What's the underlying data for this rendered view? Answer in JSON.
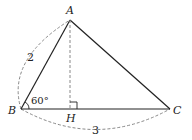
{
  "diagram": {
    "type": "triangle-geometry",
    "points": {
      "A": {
        "label": "A",
        "x": 70,
        "y": 20
      },
      "B": {
        "label": "B",
        "x": 21,
        "y": 109
      },
      "C": {
        "label": "C",
        "x": 170,
        "y": 109
      },
      "H": {
        "label": "H",
        "x": 70,
        "y": 109
      }
    },
    "segments": [
      {
        "from": "A",
        "to": "B",
        "style": "solid"
      },
      {
        "from": "A",
        "to": "C",
        "style": "solid"
      },
      {
        "from": "B",
        "to": "C",
        "style": "solid"
      },
      {
        "from": "A",
        "to": "H",
        "style": "dashed"
      }
    ],
    "measures": {
      "AB": "2",
      "BC": "3",
      "angle_B": "60°"
    },
    "right_angle_at": "H",
    "colors": {
      "line": "#222222",
      "dashed": "#888888"
    }
  }
}
